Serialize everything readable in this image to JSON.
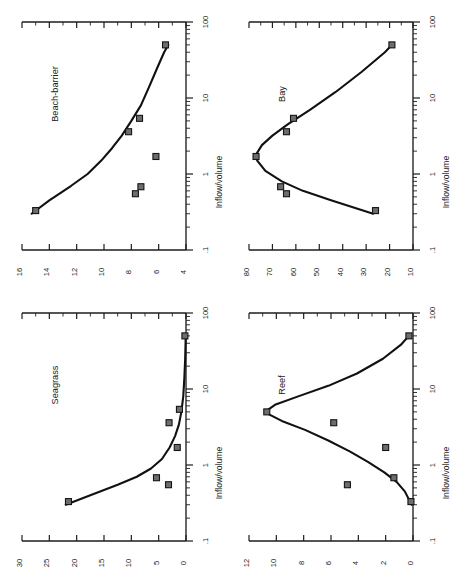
{
  "figure": {
    "panel_count": 4,
    "marker_shape": "filled square",
    "marker_color": "#6d6d6d",
    "line_color": "#111111",
    "background": "#ffffff",
    "rotation": "90 degrees counter-clockwise (landscape figure printed sideways)"
  },
  "shared": {
    "xlabel": "Inflow/volume",
    "xscale": "log",
    "xticklabels": [
      ".1",
      "1",
      "10",
      "100"
    ],
    "xlim": [
      0.1,
      100
    ],
    "grid": false,
    "legend": "none"
  },
  "chart_data": [
    {
      "type": "scatter",
      "title": "Beach-barrier",
      "xlabel": "Inflow/volume",
      "ylabel": "",
      "xscale": "log",
      "xlim": [
        0.1,
        100
      ],
      "ylim": [
        4,
        16
      ],
      "xticklabels": [
        ".1",
        "1",
        "10",
        "100"
      ],
      "yticklabels": [
        "16",
        "14",
        "12",
        "10",
        "8",
        "6",
        "4"
      ],
      "ytickvalues": [
        16,
        14,
        12,
        10,
        8,
        6,
        4
      ],
      "x": [
        0.33,
        0.55,
        0.68,
        1.7,
        3.6,
        5.4,
        50
      ],
      "y": [
        15.0,
        7.7,
        7.3,
        6.2,
        8.2,
        7.4,
        5.5
      ],
      "fit_curve": {
        "description": "monotonic decreasing curve from ~15.3 at x=0.3 falling to ~5.3 at x=50",
        "x": [
          0.3,
          0.45,
          0.7,
          1.0,
          1.5,
          2.2,
          3.2,
          5.0,
          8.0,
          14,
          25,
          40,
          50
        ],
        "y": [
          15.3,
          14.0,
          12.4,
          11.2,
          10.2,
          9.4,
          8.7,
          8.0,
          7.3,
          6.7,
          6.1,
          5.6,
          5.3
        ]
      }
    },
    {
      "type": "scatter",
      "title": "Bay",
      "xlabel": "Inflow/volume",
      "ylabel": "",
      "xscale": "log",
      "xlim": [
        0.1,
        100
      ],
      "ylim": [
        10,
        80
      ],
      "xticklabels": [
        ".1",
        "1",
        "10",
        "100"
      ],
      "yticklabels": [
        "80",
        "70",
        "60",
        "50",
        "40",
        "30",
        "20",
        "10"
      ],
      "ytickvalues": [
        80,
        70,
        60,
        50,
        40,
        30,
        20,
        10
      ],
      "x": [
        0.33,
        0.55,
        0.68,
        1.7,
        3.6,
        5.4,
        50
      ],
      "y": [
        26.0,
        64.0,
        66.5,
        77.0,
        64.0,
        61.0,
        19.0
      ],
      "fit_curve": {
        "description": "hump-shaped curve, rises from ~27 at x=0.3 to a maximum ~77 near x=1.7 then falls to ~19 at x=50",
        "x": [
          0.3,
          0.45,
          0.6,
          0.8,
          1.1,
          1.5,
          1.8,
          2.4,
          3.2,
          4.5,
          7,
          12,
          22,
          40,
          50
        ],
        "y": [
          27.0,
          45.0,
          57.0,
          66.0,
          73.0,
          76.5,
          77.0,
          74.5,
          70.0,
          63.5,
          54.0,
          43.0,
          32.0,
          22.0,
          19.0
        ]
      }
    },
    {
      "type": "scatter",
      "title": "Seagrass",
      "xlabel": "Inflow/volume",
      "ylabel": "",
      "xscale": "log",
      "xlim": [
        0.1,
        100
      ],
      "ylim": [
        0,
        30
      ],
      "xticklabels": [
        ".1",
        "1",
        "10",
        "100"
      ],
      "yticklabels": [
        "30",
        "25",
        "20",
        "15",
        "10",
        "5",
        "0"
      ],
      "ytickvalues": [
        30,
        25,
        20,
        15,
        10,
        5,
        0
      ],
      "x": [
        0.33,
        0.55,
        0.68,
        1.7,
        3.6,
        5.4,
        50
      ],
      "y": [
        21.5,
        3.2,
        5.4,
        1.6,
        3.1,
        1.2,
        0.2
      ],
      "fit_curve": {
        "description": "steep exponential decay from ~22 at x=0.3 to near 0 beyond x=10",
        "x": [
          0.3,
          0.4,
          0.55,
          0.7,
          0.9,
          1.2,
          1.7,
          2.4,
          3.4,
          5.0,
          8.0,
          14,
          25,
          50
        ],
        "y": [
          22.0,
          17.5,
          12.5,
          9.0,
          6.4,
          4.4,
          3.0,
          2.0,
          1.3,
          0.85,
          0.5,
          0.3,
          0.15,
          0.05
        ]
      }
    },
    {
      "type": "scatter",
      "title": "Reef",
      "xlabel": "Inflow/volume",
      "ylabel": "",
      "xscale": "log",
      "xlim": [
        0.1,
        100
      ],
      "ylim": [
        0,
        12
      ],
      "xticklabels": [
        ".1",
        "1",
        "10",
        "100"
      ],
      "yticklabels": [
        "12",
        "10",
        "8",
        "6",
        "4",
        "2",
        "0"
      ],
      "ytickvalues": [
        12,
        10,
        8,
        6,
        4,
        2,
        0
      ],
      "x": [
        0.33,
        0.55,
        0.68,
        1.7,
        3.6,
        5.0,
        50
      ],
      "y": [
        0.15,
        4.8,
        1.4,
        2.0,
        5.8,
        10.7,
        0.3
      ],
      "fit_curve": {
        "description": "unimodal peak curve rising from ~0.1 at x=0.3 to a maximum ~10.7 near x=5 then decaying to ~0.3 at x=50",
        "x": [
          0.3,
          0.45,
          0.6,
          0.8,
          1.1,
          1.5,
          2.1,
          2.9,
          3.8,
          4.6,
          5.2,
          6.2,
          8.0,
          11,
          16,
          25,
          38,
          50
        ],
        "y": [
          0.1,
          0.6,
          1.2,
          2.1,
          3.3,
          4.6,
          6.2,
          7.9,
          9.6,
          10.5,
          10.7,
          10.1,
          8.4,
          6.2,
          4.1,
          2.2,
          0.9,
          0.3
        ]
      }
    }
  ]
}
